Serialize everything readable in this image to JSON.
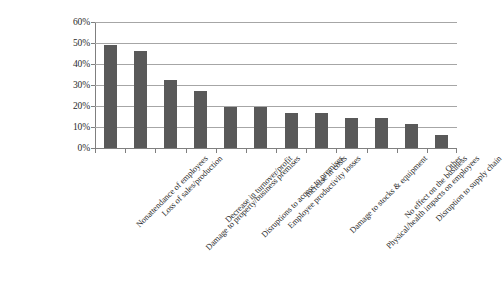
{
  "chart_data": {
    "type": "bar",
    "title": "",
    "subtitle": "",
    "xlabel": "",
    "ylabel": "",
    "ylim": [
      0,
      60
    ],
    "y_tick_labels": [
      "60%",
      "50%",
      "40%",
      "30%",
      "20%",
      "10%",
      "0%"
    ],
    "y_tick_values": [
      60,
      50,
      40,
      30,
      20,
      10,
      0
    ],
    "y_unit": "%",
    "grid": true,
    "legend": null,
    "legend_position": "none",
    "bar_color": "#595959",
    "gridline_color": "#a6a6a6",
    "axis_color": "#7f7f7f",
    "categories": [
      "Nonattendance of employees",
      "Loss of sales/production",
      "Damage to property/business premises",
      "Decrease in turnover/profit",
      "Disruptions to access to premises",
      "Employee productivity losses",
      "Increase in costs",
      "Damage to stocks & equipment",
      "Physical/health impacts on employees",
      "No effect on the business",
      "Disruption to supply chain",
      "Other"
    ],
    "values": [
      49,
      46,
      32.5,
      27,
      19.5,
      19.5,
      16.5,
      16.5,
      14.5,
      14.5,
      11.5,
      6
    ]
  }
}
